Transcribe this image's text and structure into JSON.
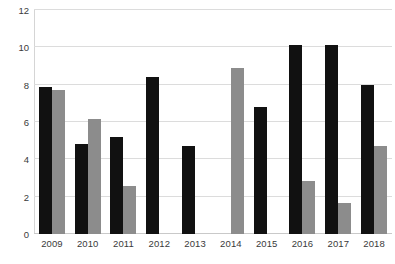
{
  "chart_data": {
    "type": "bar",
    "title": "",
    "subtitle": "",
    "xlabel": "",
    "ylabel": "",
    "ylim": [
      0,
      12
    ],
    "yticks": [
      0,
      2,
      4,
      6,
      8,
      10,
      12
    ],
    "ytick_labels": [
      "0",
      "2",
      "4",
      "6",
      "8",
      "10",
      "12"
    ],
    "grid": true,
    "legend": false,
    "legend_position": "none",
    "categories": [
      "2009",
      "2010",
      "2011",
      "2012",
      "2013",
      "2014",
      "2015",
      "2016",
      "2017",
      "2018"
    ],
    "series": [
      {
        "name": "series-1",
        "color": "#111111",
        "values": [
          7.9,
          4.8,
          5.2,
          8.4,
          4.7,
          null,
          6.8,
          10.1,
          10.15,
          8.0
        ]
      },
      {
        "name": "series-2",
        "color": "#8c8c8c",
        "values": [
          7.7,
          6.15,
          2.55,
          null,
          null,
          8.9,
          null,
          2.85,
          1.65,
          4.7
        ]
      }
    ]
  },
  "colors": {
    "series_1": "#111111",
    "series_2": "#8c8c8c",
    "gridline": "#dcdcdc",
    "background": "#ffffff",
    "tick_text": "#3a3a3a"
  }
}
